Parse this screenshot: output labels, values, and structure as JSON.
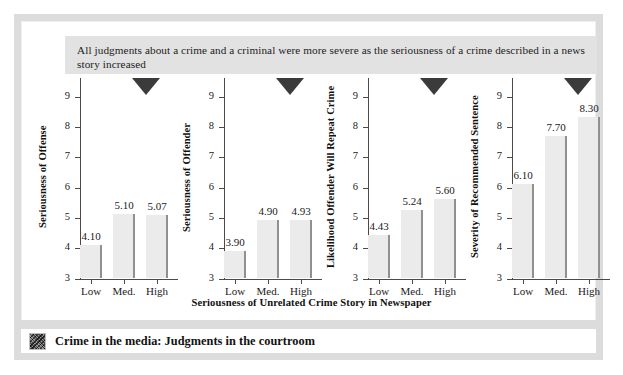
{
  "caption": {
    "text": "All judgments about a crime and a criminal were more severe as the seriousness of a crime described in a news story increased"
  },
  "footer": {
    "icon": "thumbnail-icon",
    "title": "Crime in the media: Judgments in the courtroom"
  },
  "shared": {
    "xlabel": "Seriousness of Unrelated Crime Story in Newspaper",
    "categories": [
      "Low",
      "Med.",
      "High"
    ],
    "yticks": [
      "3",
      "4",
      "5",
      "6",
      "7",
      "8",
      "9"
    ],
    "ylim_low": 3,
    "ylim_high": 9.6,
    "marker": "down-triangle"
  },
  "colors": {
    "bar_fill": "#ebebeb",
    "bar_edge": "#909090",
    "axis": "#4a4a4a",
    "caption_bg": "#e2e2e2",
    "frame": "#dcdcdc",
    "marker": "#3b3b3b"
  },
  "chart_data": [
    {
      "type": "bar",
      "title": "",
      "ylabel": "Seriousness of Offense",
      "xlabel": "Seriousness of Unrelated Crime Story in Newspaper",
      "categories": [
        "Low",
        "Med.",
        "High"
      ],
      "values": [
        4.1,
        5.1,
        5.07
      ],
      "labels": [
        "4.10",
        "5.10",
        "5.07"
      ],
      "ylim": [
        3,
        9.6
      ],
      "yticks": [
        3,
        4,
        5,
        6,
        7,
        8,
        9
      ],
      "grid": false,
      "legend": "none"
    },
    {
      "type": "bar",
      "title": "",
      "ylabel": "Seriousness of Offender",
      "xlabel": "Seriousness of Unrelated Crime Story in Newspaper",
      "categories": [
        "Low",
        "Med.",
        "High"
      ],
      "values": [
        3.9,
        4.9,
        4.93
      ],
      "labels": [
        "3.90",
        "4.90",
        "4.93"
      ],
      "ylim": [
        3,
        9.6
      ],
      "yticks": [
        3,
        4,
        5,
        6,
        7,
        8,
        9
      ],
      "grid": false,
      "legend": "none"
    },
    {
      "type": "bar",
      "title": "",
      "ylabel": "Likelihood Offender Will Repeat Crime",
      "xlabel": "Seriousness of Unrelated Crime Story in Newspaper",
      "categories": [
        "Low",
        "Med.",
        "High"
      ],
      "values": [
        4.43,
        5.24,
        5.6
      ],
      "labels": [
        "4.43",
        "5.24",
        "5.60"
      ],
      "ylim": [
        3,
        9.6
      ],
      "yticks": [
        3,
        4,
        5,
        6,
        7,
        8,
        9
      ],
      "grid": false,
      "legend": "none"
    },
    {
      "type": "bar",
      "title": "",
      "ylabel": "Severity of Recommended Sentence",
      "xlabel": "Seriousness of Unrelated Crime Story in Newspaper",
      "categories": [
        "Low",
        "Med.",
        "High"
      ],
      "values": [
        6.1,
        7.7,
        8.3
      ],
      "labels": [
        "6.10",
        "7.70",
        "8.30"
      ],
      "ylim": [
        3,
        9.6
      ],
      "yticks": [
        3,
        4,
        5,
        6,
        7,
        8,
        9
      ],
      "grid": false,
      "legend": "none"
    }
  ]
}
